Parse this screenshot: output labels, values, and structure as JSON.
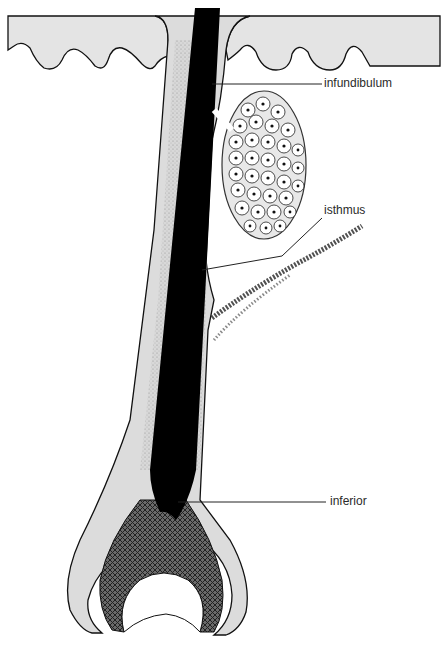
{
  "diagram": {
    "labels": [
      {
        "id": "infundibulum",
        "text": "infundibulum"
      },
      {
        "id": "isthmus",
        "text": "isthmus"
      },
      {
        "id": "inferior",
        "text": "inferior"
      }
    ],
    "colors": {
      "hair_shaft": "#000000",
      "sheath": "#dedede",
      "outline": "#1a1a1a",
      "background": "#ffffff"
    }
  }
}
